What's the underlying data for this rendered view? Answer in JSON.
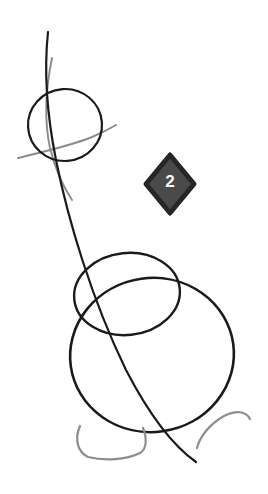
{
  "canvas": {
    "width": 268,
    "height": 494,
    "background_color": "#ffffff",
    "title": "Construction sketch - step 2"
  },
  "palette": {
    "ink_black": "#1a1a1a",
    "construction_gray": "#8d8d8d",
    "badge_fill": "#4a4a4a",
    "badge_border": "#262626",
    "badge_text": "#ffffff",
    "background": "#ffffff"
  },
  "step_badge": {
    "number": "2",
    "shape": "diamond",
    "fill_color": "#4a4a4a",
    "border_color": "#262626",
    "text_color": "#ffffff",
    "bounds": {
      "x": 146,
      "y": 155,
      "width": 48,
      "height": 58
    }
  },
  "shapes": [
    {
      "name": "head-circle",
      "type": "ellipse",
      "stroke": "#1a1a1a",
      "stroke_width": 2.2,
      "cx": 65,
      "cy": 125,
      "rx": 37,
      "ry": 36,
      "rotation": -4
    },
    {
      "name": "body-upper-ellipse",
      "type": "ellipse",
      "stroke": "#1a1a1a",
      "stroke_width": 2.4,
      "cx": 127,
      "cy": 294,
      "rx": 53,
      "ry": 41,
      "rotation": -6
    },
    {
      "name": "body-lower-ellipse",
      "type": "ellipse",
      "stroke": "#1a1a1a",
      "stroke_width": 2.6,
      "cx": 152,
      "cy": 355,
      "rx": 82,
      "ry": 77,
      "rotation": -8
    },
    {
      "name": "spine-curve",
      "type": "path",
      "stroke": "#1a1a1a",
      "stroke_width": 2.2,
      "d": "M 48 32 C 44 70, 46 110, 56 160 C 68 220, 92 300, 126 370 C 152 420, 176 448, 196 462"
    },
    {
      "name": "construction-vertical-curve",
      "type": "path",
      "stroke": "#8d8d8d",
      "stroke_width": 2.0,
      "d": "M 52 58 C 45 92, 44 120, 50 148 C 56 172, 64 188, 72 200"
    },
    {
      "name": "construction-horizontal-curve",
      "type": "path",
      "stroke": "#8d8d8d",
      "stroke_width": 2.0,
      "d": "M 18 158 C 42 152, 70 146, 92 137 C 104 132, 111 128, 116 125"
    },
    {
      "name": "foot-left-arc",
      "type": "path",
      "stroke": "#8d8d8d",
      "stroke_width": 2.2,
      "d": "M 80 426 C 74 440, 78 452, 88 457 C 104 461, 126 460, 140 453 C 147 449, 147 438, 143 428"
    },
    {
      "name": "foot-right-arc",
      "type": "path",
      "stroke": "#8d8d8d",
      "stroke_width": 2.2,
      "d": "M 197 448 C 200 436, 210 424, 224 416 C 236 410, 246 411, 250 419"
    }
  ]
}
